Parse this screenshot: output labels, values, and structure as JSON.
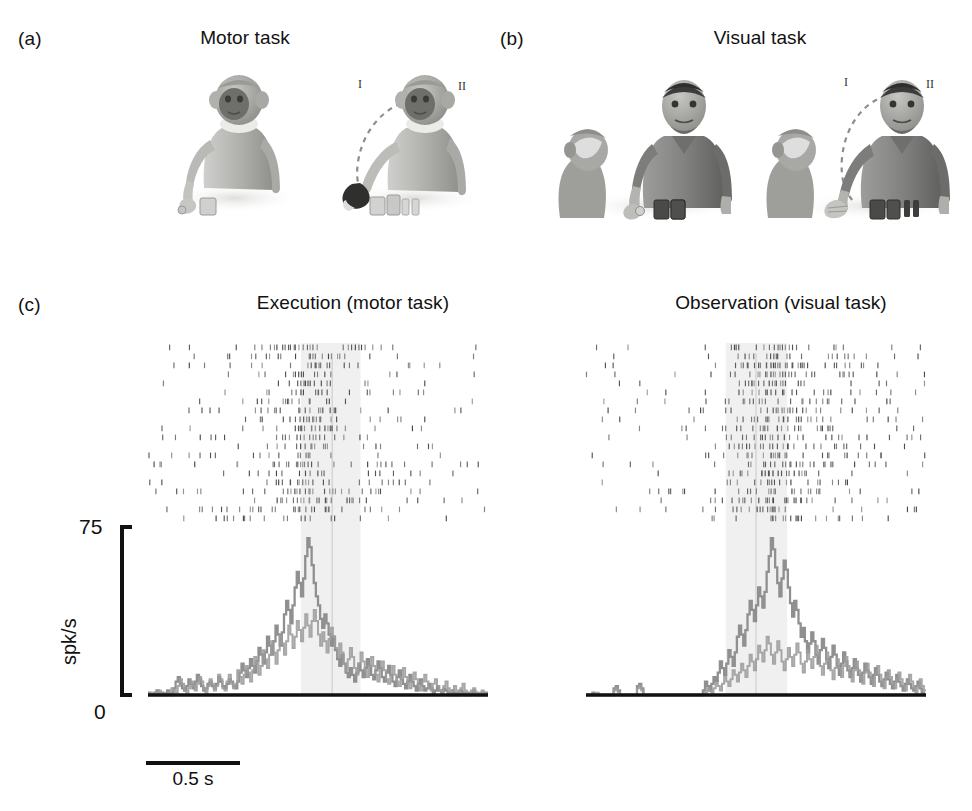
{
  "figure": {
    "panels": [
      {
        "letter": "(a)",
        "title": "Motor task"
      },
      {
        "letter": "(b)",
        "title": "Visual task"
      },
      {
        "letter": "(c)",
        "titles": [
          "Execution (motor task)",
          "Observation (visual task)"
        ]
      }
    ]
  },
  "panel_a": {
    "letter": "(a)",
    "title": "Motor task",
    "scenes": [
      {
        "name": "monkey-reaching-object",
        "actor": "monkey",
        "marker": ""
      },
      {
        "name": "monkey-grasping-object",
        "actor": "monkey",
        "marker_left": "I",
        "marker_right": "II"
      }
    ]
  },
  "panel_b": {
    "letter": "(b)",
    "title": "Visual task",
    "scenes": [
      {
        "name": "monkey-observing-human-reaching",
        "marker": ""
      },
      {
        "name": "monkey-observing-human-grasping",
        "marker_left": "I",
        "marker_right": "II"
      }
    ]
  },
  "panel_c": {
    "letter": "(c)",
    "left": {
      "title": "Execution (motor task)",
      "y_axis": {
        "max_label": "75",
        "min_label": "0",
        "unit_label": "spk/s"
      },
      "scalebar": {
        "label": "0.5 s",
        "seconds": 0.5
      }
    },
    "right": {
      "title": "Observation (visual task)"
    }
  },
  "chart_data": [
    {
      "type": "line",
      "name": "execution-sdf",
      "title": "Execution (motor task)",
      "xlabel": "",
      "ylabel": "spk/s",
      "ylim": [
        0,
        75
      ],
      "xlim": [
        -1.8,
        1.8
      ],
      "grid": false,
      "legend": null,
      "x_unit": "s",
      "shaded_window": [
        -0.18,
        0.45
      ],
      "event_marker_x": 0.15,
      "n_raster_trials": 20,
      "series": [
        {
          "name": "spike density function (trace 1)",
          "color": "#8a8a8a",
          "values": [
            1,
            0,
            0,
            1,
            2,
            0,
            1,
            0,
            0,
            2,
            1,
            0,
            3,
            6,
            8,
            5,
            3,
            2,
            4,
            7,
            5,
            3,
            6,
            9,
            7,
            4,
            2,
            3,
            5,
            6,
            4,
            3,
            5,
            8,
            6,
            4,
            3,
            5,
            7,
            6,
            4,
            3,
            6,
            10,
            14,
            11,
            8,
            12,
            16,
            13,
            10,
            15,
            21,
            18,
            14,
            19,
            26,
            22,
            18,
            24,
            31,
            27,
            22,
            28,
            36,
            42,
            38,
            32,
            40,
            48,
            55,
            50,
            44,
            52,
            62,
            70,
            66,
            58,
            50,
            44,
            40,
            34,
            30,
            36,
            32,
            27,
            22,
            26,
            20,
            16,
            13,
            18,
            14,
            10,
            8,
            12,
            9,
            6,
            10,
            14,
            11,
            8,
            12,
            16,
            13,
            9,
            7,
            11,
            15,
            12,
            8,
            6,
            10,
            13,
            9,
            6,
            4,
            8,
            11,
            7,
            5,
            3,
            6,
            9,
            6,
            4,
            2,
            5,
            7,
            4,
            2,
            3,
            5,
            3,
            1,
            2,
            4,
            2,
            1,
            3,
            2,
            1,
            0,
            2,
            1,
            0,
            1,
            2,
            1,
            0,
            1,
            0,
            1,
            2,
            1,
            0,
            0,
            1,
            0,
            1
          ]
        },
        {
          "name": "spike density function (trace 2)",
          "color": "#9b9b9b",
          "values": [
            0,
            1,
            0,
            0,
            1,
            2,
            0,
            1,
            0,
            0,
            1,
            3,
            2,
            1,
            4,
            7,
            5,
            2,
            1,
            3,
            6,
            4,
            2,
            5,
            8,
            6,
            3,
            1,
            4,
            7,
            5,
            2,
            4,
            9,
            7,
            3,
            2,
            6,
            9,
            5,
            3,
            5,
            11,
            8,
            5,
            9,
            13,
            10,
            6,
            11,
            17,
            14,
            9,
            13,
            20,
            16,
            12,
            18,
            24,
            19,
            14,
            20,
            27,
            23,
            18,
            24,
            31,
            27,
            21,
            26,
            33,
            29,
            24,
            30,
            36,
            31,
            26,
            33,
            38,
            33,
            27,
            22,
            28,
            24,
            19,
            25,
            30,
            26,
            21,
            17,
            23,
            19,
            14,
            11,
            16,
            21,
            17,
            12,
            9,
            14,
            19,
            15,
            11,
            8,
            13,
            17,
            13,
            9,
            6,
            11,
            15,
            11,
            7,
            5,
            9,
            13,
            9,
            6,
            4,
            8,
            12,
            8,
            5,
            3,
            7,
            10,
            7,
            4,
            2,
            6,
            9,
            6,
            3,
            2,
            5,
            7,
            4,
            2,
            1,
            4,
            6,
            3,
            1,
            2,
            4,
            2,
            1,
            3,
            5,
            2,
            1,
            0,
            2,
            3,
            1,
            0,
            1,
            2,
            1,
            0
          ]
        }
      ]
    },
    {
      "type": "line",
      "name": "observation-sdf",
      "title": "Observation (visual task)",
      "xlabel": "",
      "ylabel": "spk/s",
      "ylim": [
        0,
        75
      ],
      "xlim": [
        -1.8,
        1.8
      ],
      "grid": false,
      "legend": null,
      "x_unit": "s",
      "shaded_window": [
        -0.32,
        0.33
      ],
      "event_marker_x": 0.0,
      "n_raster_trials": 20,
      "series": [
        {
          "name": "spike density function (trace 1)",
          "color": "#8a8a8a",
          "values": [
            0,
            0,
            0,
            1,
            0,
            0,
            0,
            0,
            0,
            0,
            0,
            0,
            0,
            3,
            4,
            2,
            0,
            0,
            0,
            0,
            0,
            0,
            0,
            0,
            4,
            5,
            3,
            0,
            0,
            0,
            0,
            0,
            0,
            0,
            0,
            0,
            0,
            0,
            0,
            0,
            0,
            0,
            0,
            0,
            0,
            0,
            0,
            0,
            0,
            0,
            0,
            0,
            0,
            0,
            0,
            2,
            6,
            4,
            2,
            5,
            8,
            6,
            10,
            15,
            12,
            9,
            14,
            20,
            17,
            13,
            19,
            26,
            31,
            27,
            22,
            29,
            36,
            42,
            38,
            33,
            40,
            48,
            44,
            39,
            46,
            55,
            62,
            70,
            65,
            57,
            50,
            44,
            52,
            60,
            56,
            48,
            41,
            35,
            42,
            38,
            32,
            26,
            30,
            24,
            19,
            23,
            28,
            24,
            18,
            14,
            20,
            25,
            21,
            16,
            12,
            17,
            22,
            18,
            13,
            9,
            14,
            19,
            15,
            11,
            8,
            12,
            16,
            12,
            9,
            6,
            10,
            14,
            11,
            8,
            5,
            9,
            12,
            9,
            6,
            4,
            7,
            10,
            7,
            5,
            3,
            6,
            9,
            6,
            4,
            2,
            5,
            7,
            5,
            3,
            2,
            4,
            6,
            3,
            1,
            0
          ]
        },
        {
          "name": "spike density function (trace 2)",
          "color": "#9b9b9b",
          "values": [
            0,
            0,
            0,
            0,
            0,
            1,
            0,
            0,
            0,
            0,
            0,
            0,
            0,
            2,
            3,
            1,
            0,
            0,
            0,
            0,
            0,
            0,
            0,
            0,
            3,
            4,
            2,
            0,
            0,
            0,
            0,
            0,
            0,
            0,
            0,
            0,
            0,
            0,
            0,
            0,
            0,
            0,
            0,
            0,
            0,
            0,
            0,
            0,
            0,
            0,
            0,
            0,
            0,
            0,
            0,
            0,
            1,
            3,
            2,
            1,
            3,
            5,
            4,
            2,
            5,
            8,
            6,
            4,
            7,
            11,
            9,
            6,
            10,
            14,
            11,
            8,
            13,
            18,
            15,
            11,
            16,
            22,
            19,
            15,
            20,
            26,
            23,
            18,
            14,
            19,
            24,
            20,
            15,
            11,
            16,
            21,
            17,
            13,
            18,
            23,
            19,
            14,
            10,
            15,
            20,
            16,
            12,
            17,
            22,
            18,
            13,
            9,
            14,
            19,
            15,
            11,
            7,
            12,
            16,
            12,
            8,
            13,
            17,
            13,
            9,
            6,
            11,
            15,
            11,
            8,
            5,
            10,
            14,
            10,
            7,
            4,
            9,
            13,
            9,
            6,
            3,
            8,
            11,
            8,
            5,
            3,
            7,
            10,
            7,
            4,
            2,
            6,
            9,
            6,
            3,
            1,
            4,
            7,
            4,
            2
          ]
        }
      ]
    }
  ]
}
